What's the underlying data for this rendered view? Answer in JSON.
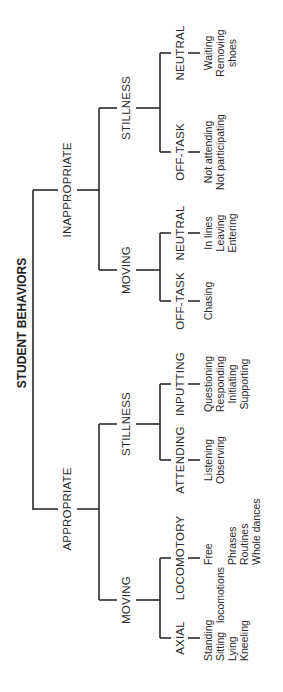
{
  "diagram": {
    "title": "STUDENT BEHAVIORS",
    "appropriate": {
      "label": "APPROPRIATE",
      "moving": {
        "label": "MOVING",
        "axial": {
          "label": "AXIAL",
          "items": [
            "Standing",
            "Sitting",
            "Lying",
            "Kneeling"
          ]
        },
        "locomotory": {
          "label": "LOCOMOTORY",
          "items": [
            "Free",
            "locomotions",
            "Phrases",
            "Routines",
            "Whole dances"
          ]
        }
      },
      "stillness": {
        "label": "STILLNESS",
        "attending": {
          "label": "ATTENDING",
          "items": [
            "Listening",
            "Observing"
          ]
        },
        "inputting": {
          "label": "INPUTTING",
          "items": [
            "Questioning",
            "Responding",
            "Initiating",
            "Supporting"
          ]
        }
      }
    },
    "inappropriate": {
      "label": "INAPPROPRIATE",
      "moving": {
        "label": "MOVING",
        "offtask": {
          "label": "OFF-TASK",
          "items": [
            "Chasing"
          ]
        },
        "neutral": {
          "label": "NEUTRAL",
          "items": [
            "In lines",
            "Leaving",
            "Entering"
          ]
        }
      },
      "stillness": {
        "label": "STILLNESS",
        "offtask": {
          "label": "OFF-TASK",
          "items": [
            "Not attending",
            "Not participating"
          ]
        },
        "neutral": {
          "label": "NEUTRAL",
          "items": [
            "Waiting",
            "Removing",
            "shoes"
          ]
        }
      }
    }
  }
}
